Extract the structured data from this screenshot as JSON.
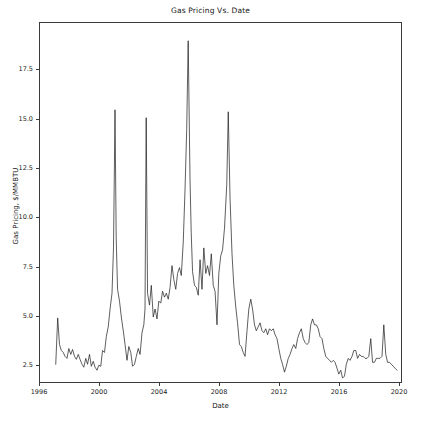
{
  "chart_data": {
    "type": "line",
    "title": "Gas Pricing Vs. Date",
    "xlabel": "Date",
    "ylabel": "Gas Pricing, $/MMBTU",
    "xlim": [
      1996,
      2020.2
    ],
    "ylim": [
      1.6,
      19.9
    ],
    "grid": false,
    "legend": null,
    "line_color": "#1a1a1a",
    "line_width": 0.7,
    "xticks": [
      1996,
      2000,
      2004,
      2008,
      2012,
      2016,
      2020
    ],
    "xtick_labels": [
      "1996",
      "2000",
      "2004",
      "2008",
      "2012",
      "2016",
      "2020"
    ],
    "yticks": [
      2.5,
      5.0,
      7.5,
      10.0,
      12.5,
      15.0,
      17.5
    ],
    "ytick_labels": [
      "2.5",
      "5.0",
      "7.5",
      "10.0",
      "12.5",
      "15.0",
      "17.5"
    ],
    "series": [
      {
        "name": "Gas Pricing",
        "x": [
          1997.05,
          1997.18,
          1997.3,
          1997.42,
          1997.55,
          1997.67,
          1997.8,
          1997.92,
          1998.05,
          1998.17,
          1998.3,
          1998.42,
          1998.55,
          1998.67,
          1998.8,
          1998.92,
          1999.05,
          1999.17,
          1999.3,
          1999.42,
          1999.55,
          1999.67,
          1999.8,
          1999.92,
          2000.05,
          2000.17,
          2000.3,
          2000.42,
          2000.55,
          2000.67,
          2000.8,
          2000.9,
          2001.0,
          2001.08,
          2001.17,
          2001.3,
          2001.42,
          2001.55,
          2001.67,
          2001.8,
          2001.92,
          2002.05,
          2002.17,
          2002.3,
          2002.42,
          2002.55,
          2002.67,
          2002.8,
          2002.92,
          2003.0,
          2003.08,
          2003.17,
          2003.3,
          2003.42,
          2003.55,
          2003.67,
          2003.8,
          2003.92,
          2004.05,
          2004.17,
          2004.3,
          2004.42,
          2004.55,
          2004.67,
          2004.8,
          2004.92,
          2005.05,
          2005.17,
          2005.3,
          2005.42,
          2005.55,
          2005.67,
          2005.78,
          2005.88,
          2006.0,
          2006.08,
          2006.17,
          2006.3,
          2006.42,
          2006.55,
          2006.67,
          2006.8,
          2006.92,
          2007.05,
          2007.17,
          2007.3,
          2007.42,
          2007.55,
          2007.67,
          2007.8,
          2007.92,
          2008.05,
          2008.17,
          2008.3,
          2008.45,
          2008.55,
          2008.67,
          2008.8,
          2008.92,
          2009.05,
          2009.17,
          2009.3,
          2009.42,
          2009.55,
          2009.67,
          2009.8,
          2009.92,
          2010.05,
          2010.17,
          2010.3,
          2010.42,
          2010.55,
          2010.67,
          2010.8,
          2010.92,
          2011.05,
          2011.17,
          2011.3,
          2011.42,
          2011.55,
          2011.67,
          2011.8,
          2011.92,
          2012.05,
          2012.17,
          2012.3,
          2012.42,
          2012.55,
          2012.67,
          2012.8,
          2012.92,
          2013.05,
          2013.17,
          2013.3,
          2013.42,
          2013.55,
          2013.67,
          2013.8,
          2013.92,
          2014.05,
          2014.17,
          2014.3,
          2014.42,
          2014.55,
          2014.67,
          2014.8,
          2014.92,
          2015.05,
          2015.17,
          2015.3,
          2015.42,
          2015.55,
          2015.67,
          2015.8,
          2015.92,
          2016.05,
          2016.17,
          2016.3,
          2016.42,
          2016.55,
          2016.67,
          2016.8,
          2016.92,
          2017.05,
          2017.17,
          2017.3,
          2017.42,
          2017.55,
          2017.67,
          2017.8,
          2017.92,
          2018.05,
          2018.17,
          2018.3,
          2018.42,
          2018.55,
          2018.67,
          2018.8,
          2018.92,
          2019.05,
          2019.17,
          2019.3,
          2019.42,
          2019.55,
          2019.67,
          2019.8
        ],
        "y": [
          2.6,
          4.95,
          3.6,
          3.3,
          3.2,
          3.0,
          2.9,
          3.4,
          3.1,
          3.35,
          3.0,
          2.85,
          3.1,
          2.85,
          2.6,
          2.45,
          2.9,
          2.6,
          3.1,
          2.5,
          2.75,
          2.45,
          2.3,
          2.55,
          2.5,
          3.3,
          3.2,
          4.0,
          4.5,
          5.4,
          6.2,
          8.5,
          15.5,
          9.0,
          6.4,
          5.8,
          5.0,
          4.3,
          3.6,
          2.8,
          3.5,
          3.2,
          2.5,
          2.6,
          3.0,
          3.4,
          3.1,
          4.2,
          4.6,
          5.4,
          15.1,
          6.2,
          5.6,
          6.6,
          5.0,
          5.4,
          4.9,
          5.8,
          5.7,
          6.3,
          6.0,
          6.2,
          5.9,
          6.5,
          7.6,
          6.9,
          6.4,
          7.2,
          7.5,
          7.1,
          8.8,
          11.5,
          14.5,
          19.0,
          12.0,
          9.3,
          7.3,
          6.6,
          6.5,
          6.1,
          7.9,
          6.4,
          8.5,
          7.2,
          7.6,
          7.1,
          8.2,
          6.6,
          6.3,
          4.6,
          7.2,
          8.1,
          8.4,
          9.5,
          11.7,
          15.4,
          11.0,
          8.2,
          6.6,
          5.5,
          4.7,
          3.6,
          3.5,
          3.2,
          3.0,
          4.3,
          5.4,
          5.9,
          5.4,
          4.6,
          4.3,
          4.5,
          4.7,
          4.3,
          4.2,
          4.4,
          4.1,
          4.4,
          4.3,
          4.4,
          4.1,
          3.9,
          3.4,
          2.9,
          2.6,
          2.2,
          2.5,
          2.9,
          3.1,
          3.4,
          3.6,
          3.4,
          3.9,
          4.2,
          4.4,
          3.9,
          3.7,
          3.6,
          3.7,
          4.6,
          4.9,
          4.6,
          4.6,
          4.4,
          4.0,
          3.9,
          3.4,
          3.0,
          2.9,
          2.8,
          2.7,
          2.8,
          2.7,
          2.4,
          2.1,
          2.3,
          1.9,
          2.0,
          2.6,
          2.9,
          2.8,
          3.0,
          3.3,
          3.3,
          2.9,
          3.1,
          3.0,
          3.0,
          2.9,
          2.9,
          3.0,
          3.9,
          2.7,
          2.7,
          2.9,
          2.9,
          2.9,
          3.0,
          4.6,
          3.1,
          2.7,
          2.7,
          2.6,
          2.5,
          2.4,
          2.3
        ]
      }
    ]
  },
  "figure": {
    "background_color": "#ffffff",
    "axes_color": "#3a3a3a"
  }
}
